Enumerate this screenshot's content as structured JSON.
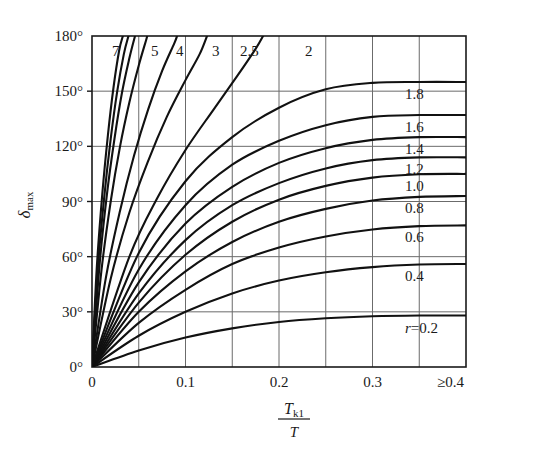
{
  "chart_data": {
    "type": "line",
    "title": "",
    "xlabel": "T_k1 / T",
    "ylabel": "delta_max",
    "xlabel_parts": {
      "numerator": "T",
      "numerator_sub": "k1",
      "denominator": "T"
    },
    "ylabel_parts": {
      "symbol": "δ",
      "sub": "max"
    },
    "xlim": [
      0,
      0.4
    ],
    "ylim": [
      0,
      180
    ],
    "x_ticks": [
      0,
      0.1,
      0.2,
      0.3,
      0.4
    ],
    "x_tick_labels": [
      "0",
      "0.1",
      "0.2",
      "0.3",
      "≥0.4"
    ],
    "x_minor_gridlines": [
      0.05,
      0.15,
      0.25,
      0.35
    ],
    "y_ticks": [
      0,
      30,
      60,
      90,
      120,
      150,
      180
    ],
    "y_tick_labels": [
      "0°",
      "30°",
      "60°",
      "90°",
      "120°",
      "150°",
      "180°"
    ],
    "grid": true,
    "legend": "curve-end-labels",
    "parameter_symbol": "r",
    "right_labels": [
      "1.8",
      "1.6",
      "1.4",
      "1.2",
      "1.0",
      "0.8",
      "0.6",
      "0.4",
      "r=0.2"
    ],
    "top_labels": [
      "7",
      "5",
      "4",
      "3",
      "2.5",
      "2"
    ],
    "series": [
      {
        "name": "r=0.2",
        "label": "r=0.2",
        "label_pos": "right",
        "plateau": 28,
        "points": [
          [
            0,
            0
          ],
          [
            0.05,
            9
          ],
          [
            0.1,
            16
          ],
          [
            0.15,
            21
          ],
          [
            0.2,
            24.5
          ],
          [
            0.25,
            26.5
          ],
          [
            0.3,
            27.6
          ],
          [
            0.35,
            28
          ],
          [
            0.4,
            28
          ]
        ]
      },
      {
        "name": "0.4",
        "label": "0.4",
        "label_pos": "right",
        "plateau": 56,
        "points": [
          [
            0,
            0
          ],
          [
            0.05,
            17
          ],
          [
            0.1,
            30
          ],
          [
            0.15,
            40
          ],
          [
            0.2,
            47
          ],
          [
            0.25,
            51.5
          ],
          [
            0.3,
            54.3
          ],
          [
            0.35,
            55.7
          ],
          [
            0.4,
            56
          ]
        ]
      },
      {
        "name": "0.6",
        "label": "0.6",
        "label_pos": "right",
        "plateau": 77,
        "points": [
          [
            0,
            0
          ],
          [
            0.05,
            24
          ],
          [
            0.1,
            42
          ],
          [
            0.15,
            56
          ],
          [
            0.2,
            65
          ],
          [
            0.25,
            71
          ],
          [
            0.3,
            74.8
          ],
          [
            0.35,
            76.6
          ],
          [
            0.4,
            77
          ]
        ]
      },
      {
        "name": "0.8",
        "label": "0.8",
        "label_pos": "right",
        "plateau": 93,
        "points": [
          [
            0,
            0
          ],
          [
            0.05,
            30
          ],
          [
            0.1,
            52
          ],
          [
            0.15,
            68
          ],
          [
            0.2,
            79
          ],
          [
            0.25,
            86
          ],
          [
            0.3,
            90.5
          ],
          [
            0.35,
            92.5
          ],
          [
            0.4,
            93
          ]
        ]
      },
      {
        "name": "1.0",
        "label": "1.0",
        "label_pos": "right",
        "plateau": 105,
        "points": [
          [
            0,
            0
          ],
          [
            0.05,
            35
          ],
          [
            0.1,
            61
          ],
          [
            0.15,
            79
          ],
          [
            0.2,
            91
          ],
          [
            0.25,
            98.5
          ],
          [
            0.3,
            103
          ],
          [
            0.35,
            104.8
          ],
          [
            0.4,
            105
          ]
        ]
      },
      {
        "name": "1.2",
        "label": "1.2",
        "label_pos": "right",
        "plateau": 114,
        "points": [
          [
            0,
            0
          ],
          [
            0.05,
            40
          ],
          [
            0.1,
            69
          ],
          [
            0.15,
            88
          ],
          [
            0.2,
            100
          ],
          [
            0.25,
            108
          ],
          [
            0.3,
            112.5
          ],
          [
            0.35,
            114
          ],
          [
            0.4,
            114
          ]
        ]
      },
      {
        "name": "1.4",
        "label": "1.4",
        "label_pos": "right",
        "plateau": 125,
        "points": [
          [
            0,
            0
          ],
          [
            0.05,
            46
          ],
          [
            0.1,
            78
          ],
          [
            0.15,
            98
          ],
          [
            0.2,
            111
          ],
          [
            0.25,
            119
          ],
          [
            0.3,
            123.5
          ],
          [
            0.35,
            125
          ],
          [
            0.4,
            125
          ]
        ]
      },
      {
        "name": "1.6",
        "label": "1.6",
        "label_pos": "right",
        "plateau": 137,
        "points": [
          [
            0,
            0
          ],
          [
            0.05,
            53
          ],
          [
            0.1,
            88
          ],
          [
            0.15,
            110
          ],
          [
            0.2,
            123
          ],
          [
            0.25,
            131.5
          ],
          [
            0.3,
            136
          ],
          [
            0.35,
            137
          ],
          [
            0.4,
            137
          ]
        ]
      },
      {
        "name": "1.8",
        "label": "1.8",
        "label_pos": "right",
        "plateau": 155,
        "points": [
          [
            0,
            0
          ],
          [
            0.05,
            62
          ],
          [
            0.1,
            101
          ],
          [
            0.15,
            125
          ],
          [
            0.2,
            141
          ],
          [
            0.25,
            151
          ],
          [
            0.3,
            154.5
          ],
          [
            0.35,
            155
          ],
          [
            0.4,
            155
          ]
        ]
      },
      {
        "name": "2",
        "label": "2",
        "label_pos": "top",
        "plateau": null,
        "points": [
          [
            0,
            0
          ],
          [
            0.04,
            60
          ],
          [
            0.07,
            92
          ],
          [
            0.1,
            118
          ],
          [
            0.13,
            140
          ],
          [
            0.155,
            158
          ],
          [
            0.175,
            173
          ],
          [
            0.183,
            180
          ]
        ]
      },
      {
        "name": "2.5",
        "label": "2.5",
        "label_pos": "top",
        "plateau": null,
        "points": [
          [
            0,
            0
          ],
          [
            0.02,
            48
          ],
          [
            0.04,
            84
          ],
          [
            0.06,
            112
          ],
          [
            0.08,
            136
          ],
          [
            0.1,
            156
          ],
          [
            0.115,
            170
          ],
          [
            0.123,
            180
          ]
        ]
      },
      {
        "name": "3",
        "label": "3",
        "label_pos": "top",
        "plateau": null,
        "points": [
          [
            0,
            0
          ],
          [
            0.015,
            49
          ],
          [
            0.03,
            85
          ],
          [
            0.045,
            115
          ],
          [
            0.06,
            140
          ],
          [
            0.075,
            161
          ],
          [
            0.088,
            176
          ],
          [
            0.091,
            180
          ]
        ]
      },
      {
        "name": "4",
        "label": "4",
        "label_pos": "top",
        "plateau": null,
        "points": [
          [
            0,
            0
          ],
          [
            0.01,
            52
          ],
          [
            0.02,
            90
          ],
          [
            0.03,
            120
          ],
          [
            0.04,
            144
          ],
          [
            0.05,
            164
          ],
          [
            0.058,
            178
          ],
          [
            0.059,
            180
          ]
        ]
      },
      {
        "name": "5",
        "label": "5",
        "label_pos": "top",
        "plateau": null,
        "points": [
          [
            0,
            0
          ],
          [
            0.008,
            55
          ],
          [
            0.016,
            94
          ],
          [
            0.024,
            124
          ],
          [
            0.032,
            149
          ],
          [
            0.04,
            168
          ],
          [
            0.046,
            180
          ]
        ]
      },
      {
        "name": "6",
        "label": "",
        "label_pos": "top",
        "plateau": null,
        "points": [
          [
            0,
            0
          ],
          [
            0.006,
            52
          ],
          [
            0.013,
            92
          ],
          [
            0.02,
            124
          ],
          [
            0.027,
            150
          ],
          [
            0.034,
            170
          ],
          [
            0.039,
            180
          ]
        ]
      },
      {
        "name": "7",
        "label": "7",
        "label_pos": "top",
        "plateau": null,
        "points": [
          [
            0,
            0
          ],
          [
            0.005,
            53
          ],
          [
            0.011,
            94
          ],
          [
            0.017,
            126
          ],
          [
            0.023,
            152
          ],
          [
            0.029,
            172
          ],
          [
            0.033,
            180
          ]
        ]
      }
    ]
  }
}
